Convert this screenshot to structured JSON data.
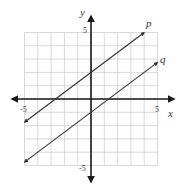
{
  "chart_data": {
    "type": "line",
    "title": "",
    "xlabel": "x",
    "ylabel": "y",
    "xlim": [
      -5,
      5
    ],
    "ylim": [
      -5,
      5
    ],
    "grid": true,
    "x_tick_labels": [
      "-5",
      "5"
    ],
    "y_tick_labels": [
      "5",
      "-5"
    ],
    "series": [
      {
        "name": "p",
        "slope": 0.75,
        "intercept": 2,
        "points": [
          [
            -5,
            -1.75
          ],
          [
            4,
            5
          ]
        ]
      },
      {
        "name": "q",
        "slope": 0.75,
        "intercept": -1,
        "points": [
          [
            -5,
            -4.75
          ],
          [
            5,
            2.75
          ]
        ]
      }
    ]
  },
  "labels": {
    "x_axis": "x",
    "y_axis": "y",
    "x_min": "-5",
    "x_max": "5",
    "y_max": "5",
    "y_min": "-5",
    "line_p": "p",
    "line_q": "q"
  },
  "colors": {
    "grid": "#cfcfcf",
    "axis": "#1a1a1a",
    "line": "#333333"
  }
}
